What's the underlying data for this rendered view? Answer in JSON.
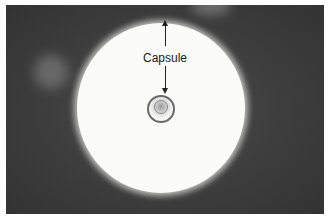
{
  "image": {
    "description": "Grayscale micrograph of an encapsulated cell in negative stain, with a large bright halo (capsule) surrounding a small central cell",
    "colors": {
      "background": "#3c3c3c",
      "capsule": "#fbfbf9",
      "border": "#ffffff"
    }
  },
  "annotation": {
    "label": "Capsule"
  }
}
